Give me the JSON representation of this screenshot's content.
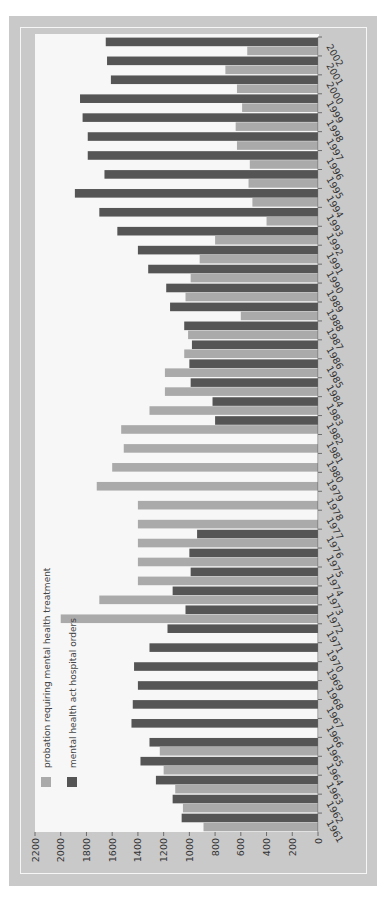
{
  "chart_data": {
    "type": "bar",
    "orientation_note": "figure printed rotated 90 degrees clockwise; values axis runs along bottom edge",
    "title": "",
    "xlabel": "",
    "ylabel": "",
    "ylim": [
      0,
      2200
    ],
    "yticks": [
      0,
      200,
      400,
      600,
      800,
      1000,
      1200,
      1400,
      1600,
      1800,
      2000,
      2200
    ],
    "grid": false,
    "legend_position": "upper-left (rotated)",
    "categories": [
      "1961",
      "1962",
      "1963",
      "1964",
      "1965",
      "1966",
      "1967",
      "1968",
      "1969",
      "1970",
      "1971",
      "1972",
      "1973",
      "1974",
      "1975",
      "1976",
      "1977",
      "1978",
      "1979",
      "1980",
      "1981",
      "1982",
      "1983",
      "1984",
      "1985",
      "1986",
      "1987",
      "1988",
      "1989",
      "1990",
      "1991",
      "1992",
      "1993",
      "1994",
      "1995",
      "1996",
      "1997",
      "1998",
      "1999",
      "2000",
      "2001",
      "2002"
    ],
    "series": [
      {
        "name": "mental health act hospital orders",
        "color": "#555555",
        "values": [
          1060,
          1130,
          1260,
          1380,
          1310,
          1450,
          1440,
          1400,
          1430,
          1310,
          1170,
          1030,
          1130,
          990,
          1000,
          940,
          null,
          null,
          null,
          null,
          null,
          800,
          820,
          990,
          1000,
          980,
          1040,
          1150,
          1180,
          1320,
          1400,
          1560,
          1700,
          1890,
          1660,
          1790,
          1790,
          1830,
          1850,
          1610,
          1640,
          1650
        ]
      },
      {
        "name": "probation requiring mental health treatment",
        "color": "#aaaaaa",
        "values": [
          890,
          1050,
          1110,
          1200,
          1230,
          null,
          null,
          null,
          null,
          null,
          null,
          2000,
          1700,
          1400,
          1400,
          1400,
          1400,
          1400,
          1720,
          1600,
          1510,
          1530,
          1310,
          1190,
          1190,
          1040,
          1010,
          600,
          1030,
          990,
          920,
          800,
          400,
          510,
          540,
          530,
          630,
          640,
          590,
          630,
          720,
          550
        ]
      }
    ]
  },
  "legend": {
    "items": [
      {
        "label": "probation requiring mental health treatment",
        "color": "#aaaaaa"
      },
      {
        "label": "mental health act hospital orders",
        "color": "#555555"
      }
    ]
  },
  "colors": {
    "frame": "#c9c9c9",
    "plot_background": "#f7f7f7",
    "axis_text": "#333333"
  }
}
